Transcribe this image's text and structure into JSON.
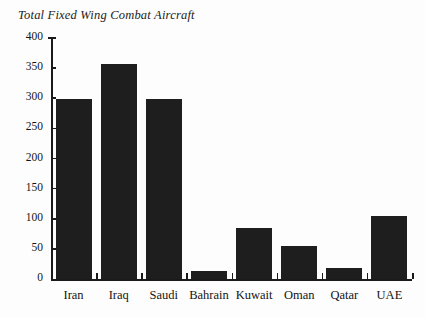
{
  "chart_data": {
    "type": "bar",
    "title": "Total Fixed Wing Combat Aircraft",
    "xlabel": "",
    "ylabel": "",
    "categories": [
      "Iran",
      "Iraq",
      "Saudi",
      "Bahrain",
      "Kuwait",
      "Oman",
      "Qatar",
      "UAE"
    ],
    "values": [
      299,
      357,
      299,
      13,
      85,
      55,
      18,
      105
    ],
    "ylim": [
      0,
      400
    ],
    "yticks": [
      0,
      50,
      100,
      150,
      200,
      250,
      300,
      350,
      400
    ],
    "ytick_labels": [
      "0",
      "50",
      "100",
      "150",
      "200",
      "250",
      "300",
      "350",
      "400"
    ],
    "grid": false,
    "legend": null,
    "bar_color": "#1e1e1e",
    "axis_color": "#1a1a1a",
    "background_color": "#fdfdfd"
  }
}
